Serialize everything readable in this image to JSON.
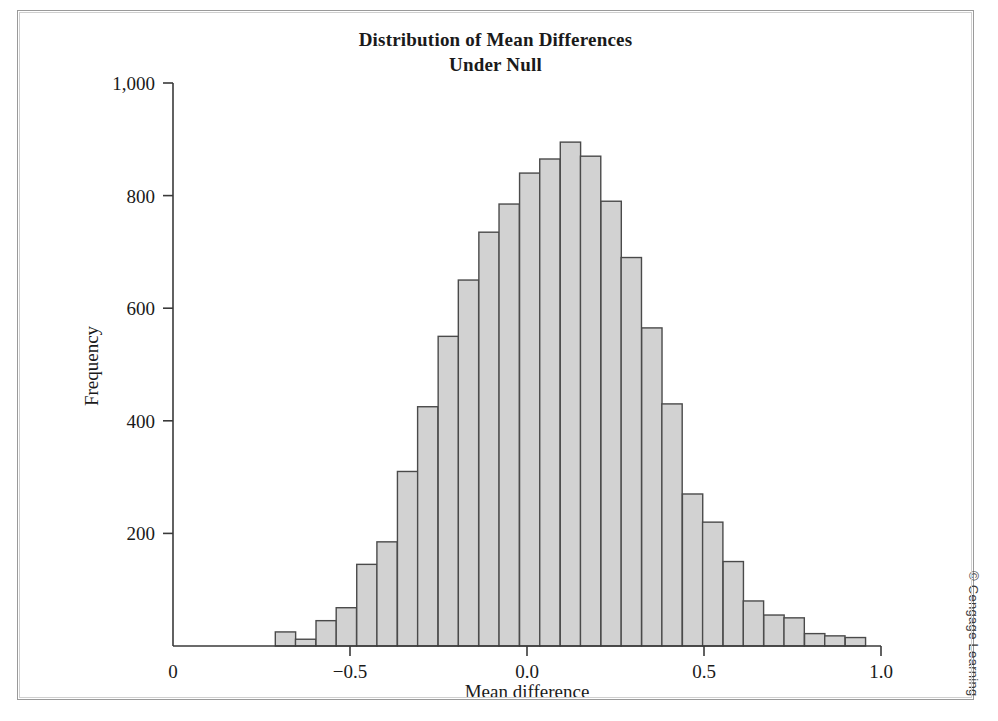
{
  "figure": {
    "title_line1": "Distribution of Mean Differences",
    "title_line2": "Under Null",
    "copyright": "© Cengage Learning"
  },
  "chart_data": {
    "type": "bar",
    "title": "Distribution of Mean Differences Under Null",
    "xlabel": "Mean difference",
    "ylabel": "Frequency",
    "xlim": [
      -1.0,
      1.0
    ],
    "ylim": [
      0,
      1000
    ],
    "xticks": [
      -1.0,
      -0.5,
      0.0,
      0.5,
      1.0
    ],
    "xticklabels": [
      "0",
      "−0.5",
      "0.0",
      "0.5",
      "1.0"
    ],
    "yticks": [
      0,
      200,
      400,
      600,
      800,
      1000
    ],
    "yticklabels": [
      "0",
      "200",
      "400",
      "600",
      "800",
      "1,000"
    ],
    "grid": false,
    "legend": null,
    "bar_color": "#d2d2d2",
    "bar_edge_color": "#4a4a4a",
    "bin_width": 0.0574,
    "bin_left_edges": [
      -0.711,
      -0.654,
      -0.596,
      -0.539,
      -0.481,
      -0.424,
      -0.366,
      -0.309,
      -0.251,
      -0.194,
      -0.136,
      -0.079,
      -0.021,
      0.036,
      0.094,
      0.151,
      0.209,
      0.266,
      0.324,
      0.381,
      0.439,
      0.496,
      0.554,
      0.611,
      0.669,
      0.726,
      0.784,
      0.841,
      0.899
    ],
    "bin_centers": [
      -0.682,
      -0.625,
      -0.567,
      -0.51,
      -0.452,
      -0.395,
      -0.337,
      -0.28,
      -0.222,
      -0.165,
      -0.107,
      -0.05,
      0.008,
      0.065,
      0.123,
      0.18,
      0.238,
      0.295,
      0.353,
      0.41,
      0.468,
      0.525,
      0.583,
      0.64,
      0.698,
      0.755,
      0.813,
      0.87,
      0.928
    ],
    "values": [
      25,
      12,
      45,
      68,
      145,
      185,
      310,
      425,
      550,
      650,
      735,
      785,
      840,
      865,
      895,
      870,
      790,
      690,
      565,
      430,
      270,
      220,
      150,
      80,
      55,
      50,
      22,
      18,
      15
    ]
  }
}
